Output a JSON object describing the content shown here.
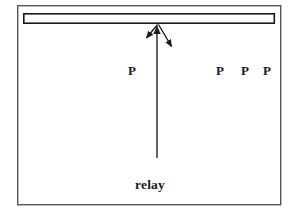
{
  "figure": {
    "caption_label": "relay",
    "frame": {
      "x": 17,
      "y": 5,
      "width": 264,
      "height": 200,
      "stroke_color": "#555555",
      "stroke_width": 1.4,
      "fill_color": "#ffffff"
    },
    "bar": {
      "name": "horizontal-bar",
      "x": 23,
      "y": 13,
      "width": 252,
      "height": 10,
      "stroke_color": "#1a1a1a",
      "stroke_width": 1.6,
      "fill_color": "#ffffff"
    },
    "vertical_arrow": {
      "name": "relay-up-arrow",
      "from_x": 157,
      "from_y": 158,
      "to_x": 157,
      "to_y": 23,
      "stroke_color": "#1a1a1a",
      "stroke_width": 1.3,
      "head_width": 8,
      "head_length": 13
    },
    "branch_arrows": [
      {
        "name": "branch-arrow-left",
        "from_x": 157,
        "from_y": 24,
        "to_x": 145,
        "to_y": 40,
        "stroke_color": "#1a1a1a",
        "stroke_width": 1.3,
        "head_width": 8,
        "head_length": 11
      },
      {
        "name": "branch-arrow-right",
        "from_x": 158,
        "from_y": 24,
        "to_x": 173,
        "to_y": 49,
        "stroke_color": "#1a1a1a",
        "stroke_width": 1.3,
        "head_width": 8,
        "head_length": 11
      }
    ],
    "p_labels": [
      {
        "name": "p-label-center",
        "text": "P",
        "x": 132,
        "y": 64
      },
      {
        "name": "p-label-right-1",
        "text": "P",
        "x": 220,
        "y": 64
      },
      {
        "name": "p-label-right-2",
        "text": "P",
        "x": 245,
        "y": 64
      },
      {
        "name": "p-label-right-3",
        "text": "P",
        "x": 267,
        "y": 64
      }
    ],
    "caption": {
      "x": 150,
      "y": 178
    },
    "colors": {
      "ink": "#1a1a1a",
      "frame": "#555555",
      "background": "#ffffff"
    }
  }
}
